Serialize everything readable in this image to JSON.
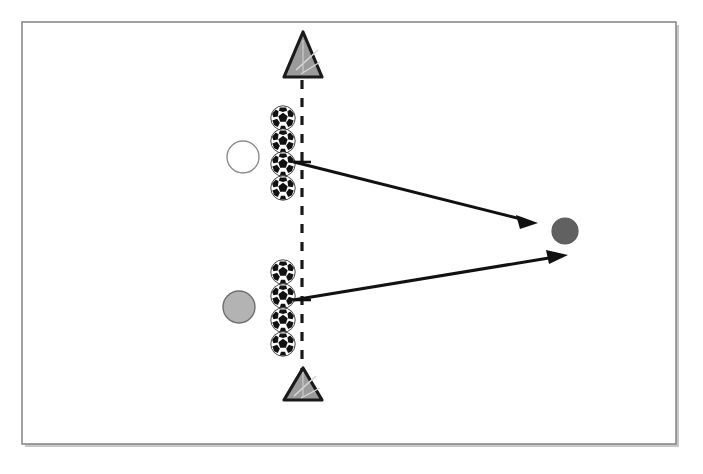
{
  "diagram": {
    "canvas": {
      "width": 703,
      "height": 474,
      "background": "#ffffff"
    },
    "frame": {
      "label": "diagram border frame",
      "x": 22,
      "y": 22,
      "width": 654,
      "height": 422,
      "stroke": "#808080",
      "stroke_width": 1.6,
      "fill": "#ffffff",
      "shadow": "#b0b0b0"
    },
    "gate_line": {
      "label": "dashed gate line",
      "x": 302,
      "y1": 80,
      "y2": 380,
      "stroke": "#1a1a1a",
      "stroke_width": 3.2,
      "dash": "9 9"
    },
    "cones": [
      {
        "name": "cone-top",
        "cx": 303,
        "cy": 62,
        "half_width": 19,
        "height": 30,
        "fill": "#9b9b9b",
        "stroke": "#1a1a1a",
        "stroke_width": 3
      },
      {
        "name": "cone-bottom",
        "cx": 303,
        "cy": 383,
        "half_width": 19,
        "height": 30,
        "fill": "#9b9b9b",
        "stroke": "#1a1a1a",
        "stroke_width": 3
      }
    ],
    "players": [
      {
        "name": "player-white",
        "role": "white player",
        "cx": 243,
        "cy": 157,
        "r": 16,
        "fill": "#ffffff",
        "stroke": "#8c8c8c",
        "stroke_width": 1.4
      },
      {
        "name": "player-gray",
        "role": "gray player",
        "cx": 239,
        "cy": 307,
        "r": 16,
        "fill": "#b3b3b3",
        "stroke": "#6e6e6e",
        "stroke_width": 1.4
      },
      {
        "name": "player-dark",
        "role": "dark target player",
        "cx": 565,
        "cy": 231,
        "r": 13,
        "fill": "#616161",
        "stroke": "#5a5a5a",
        "stroke_width": 1.2
      }
    ],
    "ball_stacks": [
      {
        "name": "ball-stack-top",
        "x": 283,
        "radius": 13,
        "positions": [
          118,
          141,
          164,
          188
        ]
      },
      {
        "name": "ball-stack-bottom",
        "x": 283,
        "radius": 13,
        "positions": [
          272,
          296,
          320,
          344
        ]
      }
    ],
    "ball_style": {
      "panel_fill": "#111111",
      "ball_fill": "#ffffff",
      "outline": "#111111"
    },
    "arrows": [
      {
        "name": "arrow-pass-upper",
        "x1": 294,
        "y1": 162,
        "x2": 536,
        "y2": 223,
        "stroke": "#111111",
        "stroke_width": 3,
        "head_size": 13
      },
      {
        "name": "arrow-pass-lower",
        "x1": 293,
        "y1": 300,
        "x2": 567,
        "y2": 255,
        "stroke": "#111111",
        "stroke_width": 3,
        "head_size": 13
      }
    ],
    "tick_marks": [
      {
        "name": "tick-upper",
        "x": 302,
        "y": 162,
        "length": 9
      },
      {
        "name": "tick-lower",
        "x": 302,
        "y": 300,
        "length": 9
      }
    ]
  }
}
